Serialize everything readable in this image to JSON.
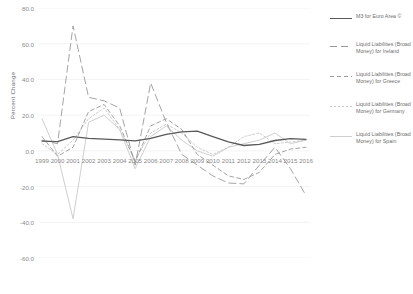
{
  "chart_data": {
    "type": "line",
    "title": "",
    "xlabel": "",
    "ylabel": "Percent Change",
    "ylim": [
      -60,
      80
    ],
    "xlim": [
      1999,
      2016
    ],
    "grid": true,
    "legend_position": "right",
    "ytick_labels": [
      "80.0",
      "60.0",
      "40.0",
      "20.0",
      "0.0",
      "-20.0",
      "-40.0",
      "-60.0"
    ],
    "ytick_values": [
      80,
      60,
      40,
      20,
      0,
      -20,
      -40,
      -60
    ],
    "x": [
      1999,
      2000,
      2001,
      2002,
      2003,
      2004,
      2005,
      2006,
      2007,
      2008,
      2009,
      2010,
      2011,
      2012,
      2013,
      2014,
      2015,
      2016
    ],
    "xtick_labels": [
      "1999",
      "2000",
      "2001",
      "2002",
      "2003",
      "2004",
      "2005",
      "2006",
      "2007",
      "2008",
      "2009",
      "2010",
      "2011",
      "2012",
      "2013",
      "2014",
      "2015",
      "2016"
    ],
    "series": [
      {
        "name": "M3 for Euro Area",
        "legend_label": "M3 for Euro Area ©",
        "color": "#595959",
        "dash": "none",
        "width": 1.3,
        "values": [
          5.5,
          5.2,
          8.0,
          7.0,
          6.6,
          6.2,
          5.6,
          7.0,
          9.2,
          10.6,
          11.0,
          8.0,
          5.0,
          3.0,
          3.6,
          5.8,
          6.8,
          6.4
        ]
      },
      {
        "name": "Liquid Liabilities (Broad Money) for Ireland",
        "legend_label": "Liquid Liabilities (Broad Money) for Ireland",
        "color": "#9a9a9a",
        "dash": "7,4",
        "width": 0.9,
        "values": [
          6.0,
          4.0,
          70.0,
          30.0,
          28.0,
          24.0,
          -8.0,
          38.0,
          16.0,
          -2.0,
          -8.0,
          -14.0,
          -18.0,
          -18.5,
          -8.0,
          2.0,
          -10.0,
          -25.0
        ]
      },
      {
        "name": "Liquid Liabilities (Broad Money) for Greece",
        "legend_label": "Liquid Liabilities (Broad Money) for Greece",
        "color": "#9a9a9a",
        "dash": "4,3",
        "width": 0.9,
        "values": [
          8.0,
          -3.0,
          2.0,
          22.0,
          26.0,
          14.0,
          -6.0,
          14.0,
          18.0,
          12.0,
          -2.0,
          -8.0,
          -14.0,
          -16.0,
          -12.0,
          -2.0,
          1.0,
          2.0
        ]
      },
      {
        "name": "Liquid Liabilities (Broad Money) for Germany",
        "legend_label": "Liquid Liabilities (Broad Money) for Germany",
        "color": "#c6c6c6",
        "dash": "2,2",
        "width": 0.9,
        "values": [
          4.0,
          -2.0,
          6.0,
          18.0,
          24.0,
          12.0,
          -5.0,
          10.0,
          15.0,
          10.0,
          2.0,
          -2.0,
          2.0,
          8.0,
          10.0,
          4.0,
          5.0,
          6.0
        ]
      },
      {
        "name": "Liquid Liabilities (Broad Money) for Spain",
        "legend_label": "Liquid Liabilities (Broad Money) for Spain",
        "color": "#cfcfcf",
        "dash": "none",
        "width": 1.0,
        "values": [
          18.0,
          -2.0,
          -38.0,
          16.0,
          20.0,
          12.0,
          -10.0,
          8.0,
          14.0,
          6.0,
          0.0,
          -3.0,
          2.0,
          4.0,
          6.0,
          10.0,
          4.0,
          6.0
        ]
      }
    ]
  }
}
